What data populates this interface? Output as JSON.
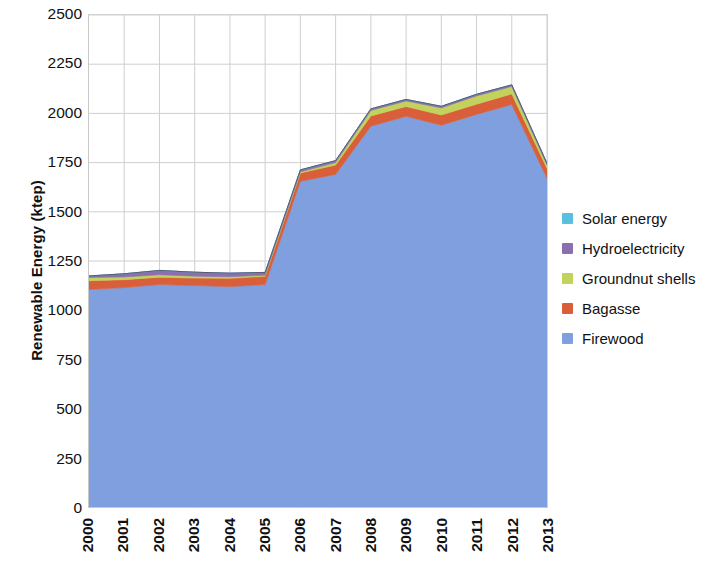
{
  "chart_data": {
    "type": "area",
    "stacked": true,
    "title": "",
    "xlabel": "",
    "ylabel": "Renewable Energy (ktep)",
    "categories": [
      "2000",
      "2001",
      "2002",
      "2003",
      "2004",
      "2005",
      "2006",
      "2007",
      "2008",
      "2009",
      "2010",
      "2011",
      "2012",
      "2013"
    ],
    "x": [
      2000,
      2001,
      2002,
      2003,
      2004,
      2005,
      2006,
      2007,
      2008,
      2009,
      2010,
      2011,
      2012,
      2013
    ],
    "ylim": [
      0,
      2500
    ],
    "ytick_values": [
      0,
      250,
      500,
      750,
      1000,
      1250,
      1500,
      1750,
      2000,
      2250,
      2500
    ],
    "ytick_labels": [
      "0",
      "250",
      "500",
      "750",
      "1000",
      "1250",
      "1500",
      "1750",
      "2000",
      "2250",
      "2500"
    ],
    "grid": true,
    "grid_axis": "both",
    "legend_position": "right",
    "series": [
      {
        "name": "Firewood",
        "color": "#7f9fdf",
        "values": [
          1105,
          1115,
          1130,
          1125,
          1120,
          1130,
          1655,
          1690,
          1935,
          1985,
          1940,
          1995,
          2045,
          1670
        ]
      },
      {
        "name": "Bagasse",
        "color": "#d95f3b",
        "values": [
          45,
          40,
          38,
          38,
          42,
          42,
          42,
          48,
          52,
          50,
          52,
          52,
          54,
          50
        ]
      },
      {
        "name": "Groundnut shells",
        "color": "#c2d25a",
        "values": [
          16,
          14,
          12,
          10,
          8,
          6,
          6,
          12,
          28,
          28,
          36,
          42,
          38,
          18
        ]
      },
      {
        "name": "Hydroelectricity",
        "color": "#8b6fb0",
        "values": [
          8,
          16,
          22,
          20,
          18,
          14,
          10,
          10,
          8,
          8,
          8,
          8,
          8,
          8
        ]
      },
      {
        "name": "Solar energy",
        "color": "#5bbfe0",
        "values": [
          0,
          0,
          0,
          0,
          0,
          0,
          0,
          0,
          0,
          0,
          0,
          0,
          0,
          0
        ]
      }
    ],
    "stack_order_bottom_to_top": [
      "Firewood",
      "Bagasse",
      "Groundnut shells",
      "Hydroelectricity",
      "Solar energy"
    ],
    "totals": [
      1174,
      1185,
      1202,
      1193,
      1188,
      1192,
      1713,
      1760,
      2023,
      2071,
      2036,
      2097,
      2145,
      1746
    ]
  },
  "legend": {
    "items": [
      {
        "label": "Solar energy",
        "color": "#5bbfe0"
      },
      {
        "label": "Hydroelectricity",
        "color": "#8b6fb0"
      },
      {
        "label": "Groundnut shells",
        "color": "#c2d25a"
      },
      {
        "label": "Bagasse",
        "color": "#d95f3b"
      },
      {
        "label": "Firewood",
        "color": "#7f9fdf"
      }
    ]
  },
  "axes": {
    "y_title": "Renewable Energy (ktep)",
    "y_ticks": [
      "2500",
      "2250",
      "2000",
      "1750",
      "1500",
      "1250",
      "1000",
      "750",
      "500",
      "250",
      "0"
    ],
    "x_ticks": [
      "2000",
      "2001",
      "2002",
      "2003",
      "2004",
      "2005",
      "2006",
      "2007",
      "2008",
      "2009",
      "2010",
      "2011",
      "2012",
      "2013"
    ]
  },
  "style": {
    "gridline_color": "#cfcfcf",
    "plot_border_color": "#c9c9c9",
    "background": "#ffffff",
    "text_color": "#111111"
  }
}
